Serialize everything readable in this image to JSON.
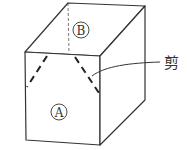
{
  "figure": {
    "type": "box-cutting-diagram",
    "labels": {
      "top_face": "B",
      "front_face": "A",
      "annotation": "剪"
    },
    "colors": {
      "line": "#333333",
      "background": "#ffffff"
    }
  }
}
